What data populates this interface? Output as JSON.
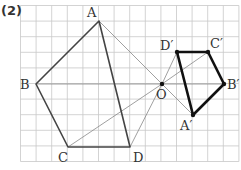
{
  "problem_number": "(2)",
  "grid": {
    "x0": 20.5,
    "y0": 5.5,
    "cell": 15.6,
    "cols": 14,
    "rows": 10,
    "line_color": "#c8c8c8"
  },
  "center": {
    "name": "O",
    "x": 162,
    "y": 84,
    "label": "O",
    "label_dx": -6,
    "label_dy": 15
  },
  "original_figure": {
    "vertices": [
      {
        "name": "A",
        "x": 99,
        "y": 21,
        "label": "A",
        "label_dx": -12,
        "label_dy": -4
      },
      {
        "name": "B",
        "x": 36,
        "y": 84,
        "label": "B",
        "label_dx": -16,
        "label_dy": 5
      },
      {
        "name": "C",
        "x": 68,
        "y": 147,
        "label": "C",
        "label_dx": -10,
        "label_dy": 15
      },
      {
        "name": "D",
        "x": 130,
        "y": 147,
        "label": "D",
        "label_dx": 3,
        "label_dy": 15
      }
    ],
    "stroke": "#444444",
    "stroke_width": 1.6
  },
  "image_figure": {
    "vertices": [
      {
        "name": "A'",
        "x": 193,
        "y": 115,
        "label": "A′",
        "label_dx": -13,
        "label_dy": 15
      },
      {
        "name": "B'",
        "x": 224,
        "y": 84,
        "label": "B′",
        "label_dx": 3,
        "label_dy": 5
      },
      {
        "name": "C'",
        "x": 208,
        "y": 52,
        "label": "C′",
        "label_dx": 2,
        "label_dy": -4
      },
      {
        "name": "D'",
        "x": 177,
        "y": 52,
        "label": "D′",
        "label_dx": -17,
        "label_dy": -2
      }
    ],
    "stroke": "#111111",
    "stroke_width": 2.6
  },
  "construction_lines": {
    "stroke": "#888888",
    "stroke_width": 0.8,
    "pairs": [
      [
        "A",
        "A'"
      ],
      [
        "B",
        "B'"
      ],
      [
        "C",
        "C'"
      ],
      [
        "D",
        "D'"
      ]
    ]
  }
}
